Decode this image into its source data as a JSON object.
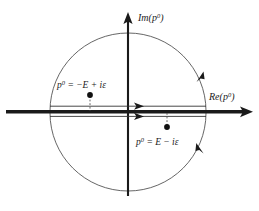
{
  "figure": {
    "name": "complex-p0-plane-contour",
    "background_color": "#ffffff",
    "stroke_color": "#1a1a1a",
    "arc_color": "#555555"
  },
  "axes": {
    "imaginary": {
      "label_base": "Im(p",
      "label_sup": "0",
      "label_close": ")",
      "label_full": "Im(p0)",
      "orientation": "vertical",
      "arrow": "up",
      "x": 128,
      "y_top": 14,
      "y_bottom": 196
    },
    "real": {
      "label_base": "Re(p",
      "label_sup": "0",
      "label_close": ")",
      "label_full": "Re(p0)",
      "orientation": "horizontal",
      "arrow": "right",
      "y": 111,
      "x_left": 6,
      "x_right": 252
    }
  },
  "circle": {
    "center_x": 128,
    "center_y": 111,
    "radius": 78,
    "upper_semicircle": "counterclockwise",
    "lower_semicircle": "counterclockwise"
  },
  "contour": {
    "upper_segment_y": 106,
    "lower_segment_y": 116,
    "left_x": 50,
    "right_x": 206,
    "direction_arrows": [
      {
        "name": "upper-contour-arrow",
        "x": 138,
        "y": 106,
        "direction": "right"
      },
      {
        "name": "lower-contour-arrow",
        "x": 138,
        "y": 116,
        "direction": "right"
      },
      {
        "name": "upper-arc-arrow",
        "x": 200,
        "y": 77,
        "direction": "counterclockwise"
      },
      {
        "name": "lower-arc-arrow",
        "x": 200,
        "y": 150,
        "direction": "counterclockwise"
      }
    ]
  },
  "poles": [
    {
      "id": "pole-upper-left",
      "label": "p0 = −E + iε",
      "label_prefix": "p",
      "label_sup": "0",
      "label_rest": " = −E + iε",
      "dot_x": 90,
      "dot_y": 95,
      "label_x": 57,
      "label_y": 85,
      "dash_to_y": 111
    },
    {
      "id": "pole-lower-right",
      "label": "p0 = E − iε",
      "label_prefix": "p",
      "label_sup": "0",
      "label_rest": " = E − iε",
      "dot_x": 167,
      "dot_y": 127,
      "label_x": 136,
      "label_y": 142,
      "dash_to_y": 113
    }
  ]
}
